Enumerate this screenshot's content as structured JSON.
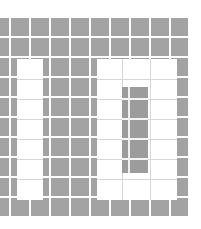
{
  "figure": {
    "colors": {
      "background": "#ffffff",
      "tile": "#a3a3a3",
      "gap": "#f4f4f4",
      "cutout": "#ffffff",
      "faint_line": "#d6d6d6",
      "inner_block": "#9c9c9c"
    },
    "grid": {
      "origin_y": 18,
      "rows": 10,
      "row_pitch": 20,
      "tile_size": 18,
      "column_lefts": [
        0,
        11,
        31,
        51,
        71,
        91,
        111,
        131,
        151,
        171
      ],
      "column_widths": [
        9,
        18,
        18,
        18,
        18,
        18,
        18,
        18,
        18,
        17
      ]
    },
    "cutouts": [
      {
        "name": "left-cutout",
        "x": 17,
        "y": 59,
        "w": 26,
        "h": 141,
        "row_ticks": [
          79,
          99,
          119,
          139,
          159,
          179
        ]
      },
      {
        "name": "right-cutout",
        "x": 97,
        "y": 59,
        "w": 80,
        "h": 141,
        "row_ticks": [
          79,
          99,
          119,
          139,
          159,
          179
        ],
        "vertical_ticks": [
          122,
          150
        ]
      }
    ],
    "inner_block": {
      "x": 122,
      "y": 87,
      "w": 26,
      "h": 86,
      "gaps_y": [
        98,
        118,
        138,
        158
      ]
    }
  }
}
